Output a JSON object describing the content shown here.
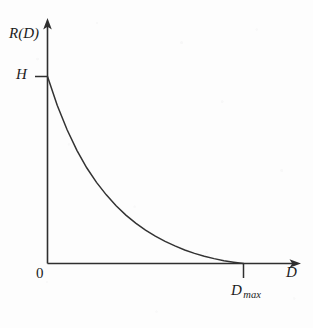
{
  "figure": {
    "kind": "line-plot",
    "background_color": "#fdfdfd",
    "ink_color": "#2b2b2b",
    "width": 313,
    "height": 328
  },
  "labels": {
    "y_axis": "R(D)",
    "x_axis": "D",
    "origin": "0",
    "h_value": "H",
    "dmax_base": "D",
    "dmax_subscript": "max"
  },
  "chart_data": {
    "type": "line",
    "title": "",
    "xlabel": "D",
    "ylabel": "R(D)",
    "grid": false,
    "legend": null,
    "xlim": [
      0,
      1
    ],
    "ylim": [
      0,
      1
    ],
    "axis_ticks": {
      "x": [
        {
          "value": 0,
          "label": "0"
        },
        {
          "value": 1,
          "label": "D max"
        }
      ],
      "y": [
        {
          "value": 0,
          "label": "0"
        },
        {
          "value": 1,
          "label": "H"
        }
      ]
    },
    "annotations": [
      {
        "text": "H",
        "x": 0,
        "y": 1,
        "note": "rate at zero distortion (source entropy)"
      },
      {
        "text": "D max",
        "x": 1,
        "y": 0,
        "note": "distortion at which rate reaches zero"
      }
    ],
    "series": [
      {
        "name": "R(D)",
        "shape": "convex-decreasing",
        "x": [
          0.0,
          0.05,
          0.1,
          0.15,
          0.2,
          0.25,
          0.3,
          0.35,
          0.4,
          0.45,
          0.5,
          0.55,
          0.6,
          0.65,
          0.7,
          0.75,
          0.8,
          0.85,
          0.9,
          0.95,
          1.0
        ],
        "y": [
          1.0,
          0.845,
          0.715,
          0.605,
          0.512,
          0.434,
          0.367,
          0.309,
          0.259,
          0.216,
          0.179,
          0.146,
          0.118,
          0.094,
          0.072,
          0.054,
          0.039,
          0.026,
          0.015,
          0.007,
          0.0
        ]
      }
    ]
  }
}
